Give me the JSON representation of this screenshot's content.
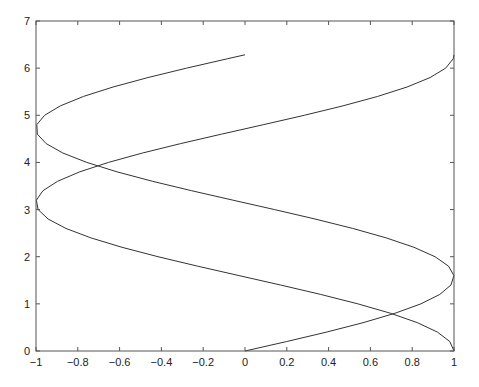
{
  "chart_data": {
    "type": "line",
    "title": "",
    "xlabel": "",
    "ylabel": "",
    "xlim": [
      -1,
      1
    ],
    "ylim": [
      0,
      7
    ],
    "grid": false,
    "legend": null,
    "xticks": [
      -1,
      -0.8,
      -0.6,
      -0.4,
      -0.2,
      0,
      0.2,
      0.4,
      0.6,
      0.8,
      1
    ],
    "xtick_labels": [
      "−1",
      "−0.8",
      "−0.6",
      "−0.4",
      "−0.2",
      "0",
      "0.2",
      "0.4",
      "0.6",
      "0.8",
      "1"
    ],
    "yticks": [
      0,
      1,
      2,
      3,
      4,
      5,
      6,
      7
    ],
    "ytick_labels": [
      "0",
      "1",
      "2",
      "3",
      "4",
      "5",
      "6",
      "7"
    ],
    "parameter": {
      "name": "t",
      "start": 0,
      "end": 6.2832,
      "step": 0.2
    },
    "series": [
      {
        "name": "sin(t) vs t",
        "x_expr": "sin(t)",
        "y_expr": "t",
        "color": "#333333"
      },
      {
        "name": "cos(t) vs t",
        "x_expr": "cos(t)",
        "y_expr": "t",
        "color": "#333333"
      }
    ]
  },
  "layout": {
    "plot_area": {
      "left": 36,
      "top": 21,
      "right": 454,
      "bottom": 351
    }
  }
}
